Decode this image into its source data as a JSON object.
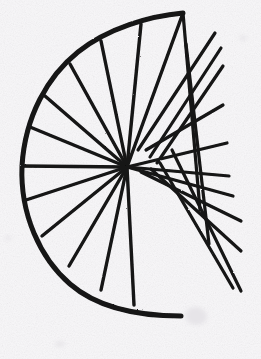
{
  "figure": {
    "title": "Hand-drawn radiant fan construction",
    "medium": "ink on paper",
    "domain_note": "geometric line drawing",
    "canvas": {
      "width": 261,
      "height": 359
    },
    "colors": {
      "background": "#f8f7f9",
      "paper_tint": "#f2f0f4",
      "ink": "#141414",
      "ink_soft": "#2b2b2b",
      "smudge": "#e6e4e8"
    },
    "stroke": {
      "arc_width": 5.0,
      "spoke_width": 3.4,
      "ray_width": 3.2,
      "linecap": "round"
    },
    "hub": {
      "x": 127,
      "y": 167,
      "label": "convergence-point"
    },
    "arc": {
      "label": "main-arc",
      "opens_toward": "right",
      "center": {
        "x": 128,
        "y": 164
      },
      "radius_x": 106,
      "radius_y": 152,
      "start_point": {
        "x": 183,
        "y": 13
      },
      "end_point": {
        "x": 181,
        "y": 316
      },
      "leftmost_point": {
        "x": 22,
        "y": 166
      },
      "path": "M 183 13 C 150 16, 108 28, 78 52 C 48 76, 25 116, 22 166 C 20 214, 40 258, 70 284 C 100 310, 146 316, 181 316"
    },
    "spokes": [
      {
        "name": "spoke-1",
        "from": {
          "x": 183,
          "y": 13
        },
        "to": {
          "x": 127,
          "y": 167
        }
      },
      {
        "name": "spoke-2",
        "from": {
          "x": 141,
          "y": 24
        },
        "to": {
          "x": 127,
          "y": 167
        }
      },
      {
        "name": "spoke-3",
        "from": {
          "x": 101,
          "y": 41
        },
        "to": {
          "x": 127,
          "y": 167
        }
      },
      {
        "name": "spoke-4",
        "from": {
          "x": 70,
          "y": 64
        },
        "to": {
          "x": 127,
          "y": 167
        }
      },
      {
        "name": "spoke-5",
        "from": {
          "x": 45,
          "y": 96
        },
        "to": {
          "x": 127,
          "y": 167
        }
      },
      {
        "name": "spoke-6",
        "from": {
          "x": 30,
          "y": 127
        },
        "to": {
          "x": 127,
          "y": 167
        }
      },
      {
        "name": "spoke-7",
        "from": {
          "x": 22,
          "y": 166
        },
        "to": {
          "x": 127,
          "y": 167
        }
      },
      {
        "name": "spoke-8",
        "from": {
          "x": 26,
          "y": 200
        },
        "to": {
          "x": 127,
          "y": 167
        }
      },
      {
        "name": "spoke-9",
        "from": {
          "x": 42,
          "y": 236
        },
        "to": {
          "x": 127,
          "y": 167
        }
      },
      {
        "name": "spoke-10",
        "from": {
          "x": 69,
          "y": 266
        },
        "to": {
          "x": 127,
          "y": 167
        }
      },
      {
        "name": "spoke-11",
        "from": {
          "x": 101,
          "y": 290
        },
        "to": {
          "x": 127,
          "y": 167
        }
      },
      {
        "name": "spoke-12",
        "from": {
          "x": 134,
          "y": 305
        },
        "to": {
          "x": 127,
          "y": 167
        }
      }
    ],
    "rays": [
      {
        "name": "ray-1",
        "from": {
          "x": 138,
          "y": 150
        },
        "to": {
          "x": 215,
          "y": 33
        }
      },
      {
        "name": "ray-2",
        "from": {
          "x": 150,
          "y": 157
        },
        "to": {
          "x": 221,
          "y": 48
        }
      },
      {
        "name": "ray-3",
        "from": {
          "x": 157,
          "y": 163
        },
        "to": {
          "x": 223,
          "y": 66
        }
      },
      {
        "name": "ray-4",
        "from": {
          "x": 146,
          "y": 150
        },
        "to": {
          "x": 223,
          "y": 105
        }
      },
      {
        "name": "ray-5",
        "from": {
          "x": 127,
          "y": 167
        },
        "to": {
          "x": 227,
          "y": 143
        }
      },
      {
        "name": "ray-6",
        "from": {
          "x": 127,
          "y": 167
        },
        "to": {
          "x": 229,
          "y": 176
        }
      },
      {
        "name": "ray-7",
        "from": {
          "x": 127,
          "y": 167
        },
        "to": {
          "x": 233,
          "y": 196
        }
      },
      {
        "name": "ray-8",
        "from": {
          "x": 141,
          "y": 172
        },
        "to": {
          "x": 241,
          "y": 221
        }
      },
      {
        "name": "ray-9",
        "from": {
          "x": 151,
          "y": 169
        },
        "to": {
          "x": 241,
          "y": 251
        }
      },
      {
        "name": "ray-10",
        "from": {
          "x": 160,
          "y": 163
        },
        "to": {
          "x": 233,
          "y": 288
        }
      },
      {
        "name": "ray-11",
        "from": {
          "x": 172,
          "y": 150
        },
        "to": {
          "x": 241,
          "y": 291
        }
      },
      {
        "name": "ray-12",
        "from": {
          "x": 186,
          "y": 44
        },
        "to": {
          "x": 209,
          "y": 244
        }
      },
      {
        "name": "ray-13",
        "from": {
          "x": 183,
          "y": 13
        },
        "to": {
          "x": 200,
          "y": 210
        }
      }
    ],
    "smudges": [
      {
        "name": "smudge-top-right",
        "x": 243,
        "y": 38,
        "w": 7,
        "h": 5,
        "rot": 20
      },
      {
        "name": "smudge-mid-left",
        "x": 8,
        "y": 238,
        "w": 6,
        "h": 4,
        "rot": -12
      },
      {
        "name": "smudge-bottom",
        "x": 196,
        "y": 316,
        "w": 22,
        "h": 18,
        "rot": 8
      },
      {
        "name": "smudge-corner",
        "x": 60,
        "y": 344,
        "w": 10,
        "h": 5,
        "rot": -5
      }
    ]
  }
}
